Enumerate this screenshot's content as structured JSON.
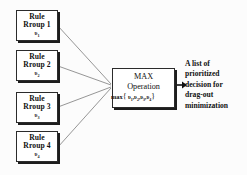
{
  "diagram": {
    "type": "flow-diagram",
    "background_color": "#fcfcfc",
    "line_color": "#8a8a8a",
    "border_color": "#2b2b2b",
    "shadow_color": "#1d1d1d"
  },
  "rule_nodes": [
    {
      "title_line1": "Rule",
      "title_line2": "Rroup 1",
      "symbol": "υ",
      "index": "1"
    },
    {
      "title_line1": "Rule",
      "title_line2": "Rroup 2",
      "symbol": "υ",
      "index": "2"
    },
    {
      "title_line1": "Rule",
      "title_line2": "Rroup 3",
      "symbol": "υ",
      "index": "3"
    },
    {
      "title_line1": "Rule",
      "title_line2": "Rroup 4",
      "symbol": "υ",
      "index": "4"
    }
  ],
  "max_node": {
    "title_line1": "MAX",
    "title_line2": "Operation",
    "formula_prefix": "max",
    "formula_open": "{",
    "formula_args": [
      {
        "symbol": "υ",
        "index": "1"
      },
      {
        "symbol": "υ",
        "index": "2"
      },
      {
        "symbol": "υ",
        "index": "3"
      },
      {
        "symbol": "υ",
        "index": "4"
      }
    ],
    "formula_close": "}"
  },
  "output": {
    "line1": "A list of",
    "line2": "prioritized",
    "line3": "decision for",
    "line4": "drag-out",
    "line5": "minimization"
  }
}
